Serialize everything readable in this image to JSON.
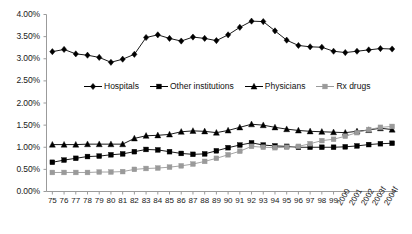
{
  "chart_data": {
    "type": "line",
    "title": "",
    "subtitle": "",
    "xlabel": "",
    "ylabel": "",
    "ylim": [
      0,
      4.0
    ],
    "ytick_format": "percent",
    "grid": false,
    "legend_position": "inside-upper-center",
    "categories": [
      "75",
      "76",
      "77",
      "78",
      "79",
      "80",
      "81",
      "82",
      "83",
      "84",
      "85",
      "86",
      "87",
      "88",
      "89",
      "90",
      "91",
      "92",
      "93",
      "94",
      "95",
      "96",
      "97",
      "98",
      "99",
      "2000",
      "2001",
      "2002",
      "2003f",
      "2004f"
    ],
    "ytick_labels": [
      "0.00%",
      "0.50%",
      "1.00%",
      "1.50%",
      "2.00%",
      "2.50%",
      "3.00%",
      "3.50%",
      "4.00%"
    ],
    "ytick_values": [
      0,
      0.5,
      1.0,
      1.5,
      2.0,
      2.5,
      3.0,
      3.5,
      4.0
    ],
    "series": [
      {
        "name": "Hospitals",
        "marker": "diamond",
        "color": "#000000",
        "values": [
          3.16,
          3.21,
          3.11,
          3.08,
          3.03,
          2.92,
          2.99,
          3.1,
          3.48,
          3.54,
          3.46,
          3.4,
          3.49,
          3.46,
          3.41,
          3.54,
          3.71,
          3.85,
          3.84,
          3.63,
          3.42,
          3.3,
          3.27,
          3.26,
          3.17,
          3.14,
          3.17,
          3.2,
          3.23,
          3.22
        ]
      },
      {
        "name": "Other institutions",
        "marker": "square",
        "color": "#000000",
        "values": [
          0.66,
          0.71,
          0.75,
          0.79,
          0.8,
          0.83,
          0.85,
          0.9,
          0.95,
          0.94,
          0.9,
          0.86,
          0.84,
          0.85,
          0.92,
          0.99,
          1.05,
          1.1,
          1.05,
          1.03,
          1.02,
          1.0,
          1.0,
          1.0,
          1.0,
          1.01,
          1.03,
          1.06,
          1.08,
          1.09
        ]
      },
      {
        "name": "Physicians",
        "marker": "triangle",
        "color": "#000000",
        "values": [
          1.06,
          1.06,
          1.06,
          1.07,
          1.07,
          1.07,
          1.07,
          1.2,
          1.26,
          1.27,
          1.29,
          1.35,
          1.37,
          1.36,
          1.33,
          1.38,
          1.45,
          1.52,
          1.5,
          1.45,
          1.41,
          1.38,
          1.36,
          1.35,
          1.34,
          1.33,
          1.36,
          1.39,
          1.43,
          1.4
        ]
      },
      {
        "name": "Rx drugs",
        "marker": "square",
        "color": "#9a9a9a",
        "values": [
          0.43,
          0.43,
          0.43,
          0.43,
          0.44,
          0.44,
          0.45,
          0.5,
          0.52,
          0.53,
          0.55,
          0.58,
          0.62,
          0.68,
          0.75,
          0.83,
          0.91,
          1.02,
          1.0,
          0.99,
          1.0,
          1.02,
          1.08,
          1.15,
          1.18,
          1.25,
          1.33,
          1.4,
          1.45,
          1.47
        ]
      }
    ]
  },
  "legend": {
    "items": [
      {
        "label": "Hospitals",
        "marker": "diamond",
        "color": "#000000"
      },
      {
        "label": "Other institutions",
        "marker": "square",
        "color": "#000000"
      },
      {
        "label": "Physicians",
        "marker": "triangle",
        "color": "#000000"
      },
      {
        "label": "Rx drugs",
        "marker": "square",
        "color": "#9a9a9a"
      }
    ]
  },
  "axes": {
    "y_axis_name": "percent-axis",
    "x_axis_name": "year-axis"
  }
}
